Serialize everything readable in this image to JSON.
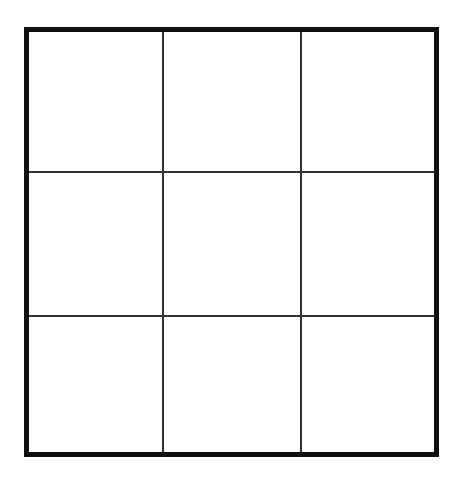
{
  "board": {
    "rows": 3,
    "cols": 3,
    "cells": [
      [
        "",
        "",
        ""
      ],
      [
        "",
        "",
        ""
      ],
      [
        "",
        "",
        ""
      ]
    ],
    "colors": {
      "border": "#111111",
      "grid_line": "#333333",
      "background": "#ffffff"
    }
  }
}
